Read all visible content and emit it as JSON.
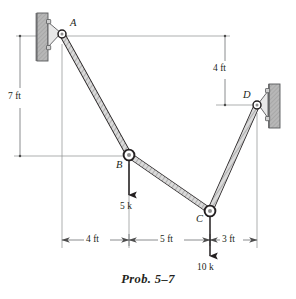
{
  "figure": {
    "caption": "Prob. 5–7",
    "joints": [
      {
        "id": "A",
        "label": "A",
        "x": 62,
        "y": 34
      },
      {
        "id": "B",
        "label": "B",
        "x": 129,
        "y": 155
      },
      {
        "id": "C",
        "label": "C",
        "x": 210,
        "y": 211
      },
      {
        "id": "D",
        "label": "D",
        "x": 257,
        "y": 105
      }
    ],
    "supports": [
      {
        "name": "pin-support-a",
        "at": "A",
        "side": "left"
      },
      {
        "name": "pin-support-d",
        "at": "D",
        "side": "right"
      }
    ],
    "members": [
      {
        "name": "member-ab",
        "from": "A",
        "to": "B"
      },
      {
        "name": "member-bc",
        "from": "B",
        "to": "C"
      },
      {
        "name": "member-cd",
        "from": "C",
        "to": "D"
      }
    ],
    "loads": [
      {
        "name": "load-at-b",
        "at": "B",
        "label": "5 k",
        "magnitude": 5,
        "unit": "k",
        "direction": "down"
      },
      {
        "name": "load-at-c",
        "at": "C",
        "label": "10 k",
        "magnitude": 10,
        "unit": "k",
        "direction": "down"
      }
    ],
    "dimensions": {
      "vertical": [
        {
          "name": "dim-7ft",
          "label": "7 ft",
          "value": 7,
          "unit": "ft",
          "from": "A",
          "to": "B"
        },
        {
          "name": "dim-4ft-vertical",
          "label": "4 ft",
          "value": 4,
          "unit": "ft",
          "from": "A",
          "to": "D"
        }
      ],
      "horizontal": [
        {
          "name": "dim-4ft-horizontal",
          "label": "4 ft",
          "value": 4,
          "unit": "ft",
          "from": "A",
          "to": "B"
        },
        {
          "name": "dim-5ft",
          "label": "5 ft",
          "value": 5,
          "unit": "ft",
          "from": "B",
          "to": "C"
        },
        {
          "name": "dim-3ft",
          "label": "3 ft",
          "value": 3,
          "unit": "ft",
          "from": "C",
          "to": "D"
        }
      ]
    },
    "colors": {
      "line": "#231f20",
      "dim_line": "#6d6e71",
      "member_fill": "#d9d9d9",
      "member_stroke": "#231f20",
      "wall_fill": "#b3b3b3",
      "wall_stroke": "#4d4d4d",
      "background": "#ffffff"
    }
  }
}
